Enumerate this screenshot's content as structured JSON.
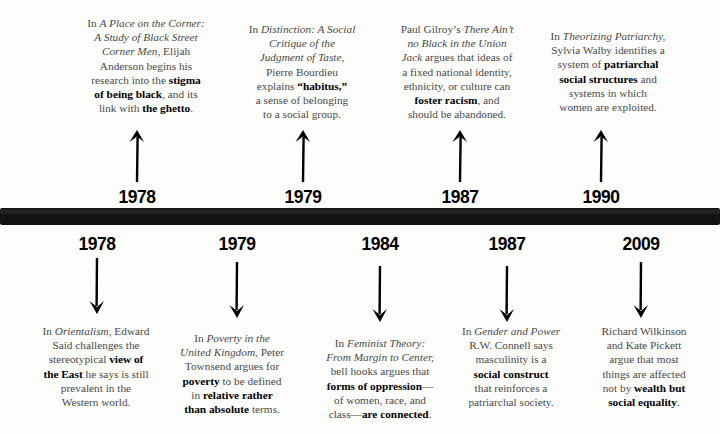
{
  "timeline": {
    "bar_color": "#131313",
    "text_color": "#4a4a4a",
    "emphasis_color": "#000000"
  },
  "top_events": [
    {
      "year": "1978",
      "arrow": "arrow-up-icon",
      "text_plain": "In A Place on the Corner: A Study of Black Street Corner Men, Elijah Anderson begins his research into the stigma of being black, and its link with the ghetto.",
      "text_html": "In <i>A Place on the Corner:<br>A Study of Black Street<br>Corner Men</i>, Elijah<br>Anderson begins his<br>research into the <b>stigma<br>of being black</b>, and its<br>link with <b>the ghetto</b>."
    },
    {
      "year": "1979",
      "arrow": "arrow-up-icon",
      "text_plain": "In Distinction: A Social Critique of the Judgment of Taste, Pierre Bourdieu explains \"habitus,\" a sense of belonging to a social group.",
      "text_html": "In <i>Distinction: A Social<br>Critique of the<br>Judgment of Taste,</i><br>Pierre Bourdieu<br>explains <b>&ldquo;habitus,&rdquo;</b><br>a sense of belonging<br>to a social group."
    },
    {
      "year": "1987",
      "arrow": "arrow-up-icon",
      "text_plain": "Paul Gilroy's There Ain't no Black in the Union Jack argues that ideas of a fixed national identity, ethnicity, or culture can foster racism, and should be abandoned.",
      "text_html": "Paul Gilroy&rsquo;s <i>There Ain&rsquo;t<br>no Black in the Union<br>Jack</i> argues that ideas of<br>a fixed national identity,<br>ethnicity, or culture can<br><b>foster racism</b>, and<br>should be abandoned."
    },
    {
      "year": "1990",
      "arrow": "arrow-up-icon",
      "text_plain": "In Theorizing Patriarchy, Sylvia Walby identifies a system of patriarchal social structures and systems in which women are exploited.",
      "text_html": "In <i>Theorizing Patriarchy,</i><br>Sylvia Walby identifies a<br>system of <b>patriarchal<br>social structures</b> and<br>systems in which<br>women are exploited."
    }
  ],
  "bottom_events": [
    {
      "year": "1978",
      "arrow": "arrow-down-icon",
      "text_plain": "In Orientalism, Edward Said challenges the stereotypical view of the East he says is still prevalent in the Western world.",
      "text_html": "In <i>Orientalism</i>, Edward<br>Said challenges the<br>stereotypical <b>view of<br>the East</b> he says is still<br>prevalent in the<br>Western world."
    },
    {
      "year": "1979",
      "arrow": "arrow-down-icon",
      "text_plain": "In Poverty in the United Kingdom, Peter Townsend argues for poverty to be defined in relative rather than absolute terms.",
      "text_html": "In <i>Poverty in the<br>United Kingdom</i>, Peter<br>Townsend argues for<br><b>poverty</b> to be defined<br>in <b>relative rather<br>than absolute</b> terms."
    },
    {
      "year": "1984",
      "arrow": "arrow-down-icon",
      "text_plain": "In Feminist Theory: From Margin to Center, bell hooks argues that forms of oppression—of women, race, and class—are connected.",
      "text_html": "In <i>Feminist Theory:<br>From Margin to Center,</i><br>bell hooks argues that<br><b>forms of oppression</b>&mdash;<br>of women, race, and<br>class&mdash;<b>are connected</b>."
    },
    {
      "year": "1987",
      "arrow": "arrow-down-icon",
      "text_plain": "In Gender and Power R.W. Connell says masculinity is a social construct that reinforces a patriarchal society.",
      "text_html": "In <i>Gender and Power</i><br>R.W. Connell says<br>masculinity is a<br><b>social construct</b><br>that reinforces a<br>patriarchal society."
    },
    {
      "year": "2009",
      "arrow": "arrow-down-icon",
      "text_plain": "Richard Wilkinson and Kate Pickett argue that most things are affected not by wealth but social equality.",
      "text_html": "Richard Wilkinson<br>and Kate Pickett<br>argue that most<br>things are affected<br>not by <b>wealth but<br>social equality</b>."
    }
  ]
}
